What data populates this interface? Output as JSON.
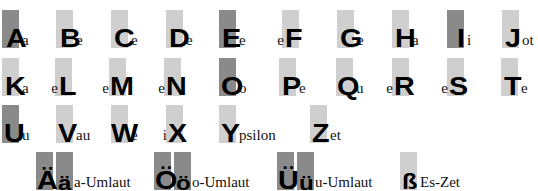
{
  "colors": {
    "dark": "#8a8a8a",
    "light": "#cfcfcf",
    "text": "#000000"
  },
  "letters": [
    {
      "id": "A",
      "big": "A",
      "prefix": "",
      "suffix": "a",
      "x": 2,
      "y": 10,
      "shade": "dark",
      "bigx": 4
    },
    {
      "id": "B",
      "big": "B",
      "prefix": "",
      "suffix": "e",
      "x": 56,
      "y": 10,
      "shade": "light",
      "bigx": 4
    },
    {
      "id": "C",
      "big": "C",
      "prefix": "",
      "suffix": "e",
      "x": 111,
      "y": 10,
      "shade": "light",
      "bigx": 3
    },
    {
      "id": "D",
      "big": "D",
      "prefix": "",
      "suffix": "e",
      "x": 166,
      "y": 10,
      "shade": "light",
      "bigx": 3
    },
    {
      "id": "E",
      "big": "E",
      "prefix": "",
      "suffix": "e",
      "x": 219,
      "y": 10,
      "shade": "dark",
      "bigx": 3
    },
    {
      "id": "F",
      "big": "F",
      "prefix": "e",
      "suffix": "",
      "x": 282,
      "y": 10,
      "shade": "light",
      "bigx": 3
    },
    {
      "id": "G",
      "big": "G",
      "prefix": "",
      "suffix": "e",
      "x": 337,
      "y": 10,
      "shade": "light",
      "bigx": 3
    },
    {
      "id": "H",
      "big": "H",
      "prefix": "",
      "suffix": "a",
      "x": 392,
      "y": 10,
      "shade": "light",
      "bigx": 3
    },
    {
      "id": "I",
      "big": "I",
      "prefix": "",
      "suffix": "i",
      "x": 447,
      "y": 10,
      "shade": "dark",
      "bigx": 10
    },
    {
      "id": "J",
      "big": "J",
      "prefix": "",
      "suffix": "ot",
      "x": 502,
      "y": 10,
      "shade": "light",
      "bigx": 3
    },
    {
      "id": "K",
      "big": "K",
      "prefix": "",
      "suffix": "a",
      "x": 2,
      "y": 58,
      "shade": "light",
      "bigx": 3
    },
    {
      "id": "L",
      "big": "L",
      "prefix": "e",
      "suffix": "",
      "x": 55,
      "y": 58,
      "shade": "light",
      "bigx": 4
    },
    {
      "id": "M",
      "big": "M",
      "prefix": "e",
      "suffix": "",
      "x": 109,
      "y": 58,
      "shade": "light",
      "bigx": 1
    },
    {
      "id": "N",
      "big": "N",
      "prefix": "e",
      "suffix": "",
      "x": 164,
      "y": 58,
      "shade": "light",
      "bigx": 2
    },
    {
      "id": "O",
      "big": "O",
      "prefix": "",
      "suffix": "o",
      "x": 219,
      "y": 58,
      "shade": "dark",
      "bigx": 2
    },
    {
      "id": "P",
      "big": "P",
      "prefix": "",
      "suffix": "e",
      "x": 279,
      "y": 58,
      "shade": "light",
      "bigx": 3
    },
    {
      "id": "Q",
      "big": "Q",
      "prefix": "",
      "suffix": "u",
      "x": 336,
      "y": 58,
      "shade": "light",
      "bigx": 1
    },
    {
      "id": "R",
      "big": "R",
      "prefix": "e",
      "suffix": "",
      "x": 392,
      "y": 58,
      "shade": "light",
      "bigx": 2
    },
    {
      "id": "S",
      "big": "S",
      "prefix": "e",
      "suffix": "",
      "x": 447,
      "y": 58,
      "shade": "light",
      "bigx": 2
    },
    {
      "id": "T",
      "big": "T",
      "prefix": "",
      "suffix": "e",
      "x": 501,
      "y": 58,
      "shade": "light",
      "bigx": 3
    },
    {
      "id": "U",
      "big": "U",
      "prefix": "",
      "suffix": "u",
      "x": 2,
      "y": 105,
      "shade": "dark",
      "bigx": 2
    },
    {
      "id": "V",
      "big": "V",
      "prefix": "",
      "suffix": "au",
      "x": 56,
      "y": 105,
      "shade": "light",
      "bigx": 2
    },
    {
      "id": "W",
      "big": "W",
      "prefix": "",
      "suffix": "e",
      "x": 111,
      "y": 105,
      "shade": "light",
      "bigx": 0
    },
    {
      "id": "X",
      "big": "X",
      "prefix": "i",
      "suffix": "",
      "x": 166,
      "y": 105,
      "shade": "light",
      "bigx": 2
    },
    {
      "id": "Y",
      "big": "Y",
      "prefix": "",
      "suffix": "psilon",
      "x": 219,
      "y": 105,
      "shade": "light",
      "bigx": 2
    },
    {
      "id": "Z",
      "big": "Z",
      "prefix": "",
      "suffix": "et",
      "x": 310,
      "y": 105,
      "shade": "light",
      "bigx": 2
    }
  ],
  "umlauts": [
    {
      "id": "ae",
      "upper": "Ä",
      "lower": "ä",
      "label": "a-Umlaut",
      "x": 36,
      "y": 152,
      "shade": "dark"
    },
    {
      "id": "oe",
      "upper": "Ö",
      "lower": "ö",
      "label": "o-Umlaut",
      "x": 154,
      "y": 152,
      "shade": "dark"
    },
    {
      "id": "ue",
      "upper": "Ü",
      "lower": "ü",
      "label": "u-Umlaut",
      "x": 277,
      "y": 152,
      "shade": "dark"
    }
  ],
  "eszett": {
    "char": "ß",
    "label": "Es-Zet",
    "x": 400,
    "y": 152,
    "shade": "light"
  }
}
